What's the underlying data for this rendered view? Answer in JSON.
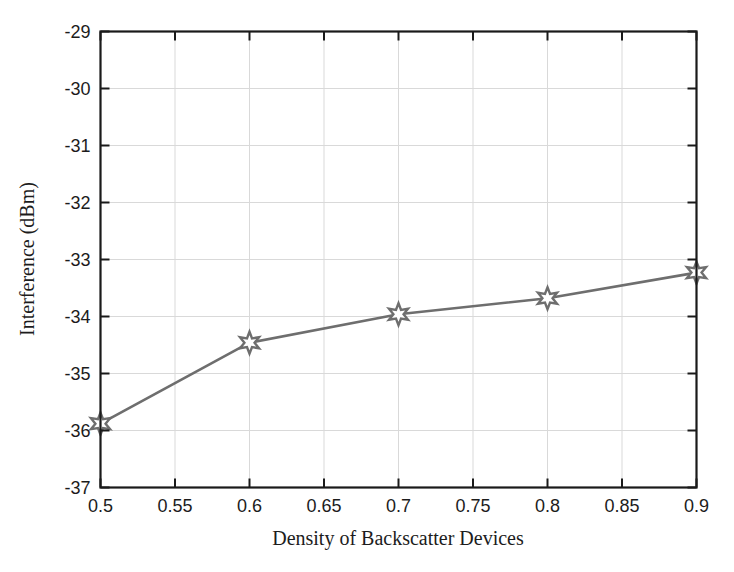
{
  "figure": {
    "background_color": "#ffffff",
    "axis_color": "#1a1a1a",
    "grid_color": "#d9d9d9",
    "series_color": "#6e6e6e",
    "marker_fill": "#ffffff"
  },
  "chart_data": {
    "type": "line",
    "title": "",
    "subtitle": "",
    "xlabel": "Density of Backscatter Devices",
    "ylabel": "Interference (dBm)",
    "xlim": [
      0.5,
      0.9
    ],
    "ylim": [
      -37,
      -29
    ],
    "grid": true,
    "legend": null,
    "legend_position": "none",
    "xticks": [
      0.5,
      0.55,
      0.6,
      0.65,
      0.7,
      0.75,
      0.8,
      0.85,
      0.9
    ],
    "xtick_labels": [
      "0.5",
      "0.55",
      "0.6",
      "0.65",
      "0.7",
      "0.75",
      "0.8",
      "0.85",
      "0.9"
    ],
    "yticks": [
      -37,
      -36,
      -35,
      -34,
      -33,
      -32,
      -31,
      -30,
      -29
    ],
    "ytick_labels": [
      "-37",
      "-36",
      "-35",
      "-34",
      "-33",
      "-32",
      "-31",
      "-30",
      "-29"
    ],
    "marker": "hexagram",
    "series": [
      {
        "name": "Interference",
        "x": [
          0.5,
          0.6,
          0.7,
          0.8,
          0.9
        ],
        "values": [
          -35.88,
          -34.46,
          -33.96,
          -33.68,
          -33.23
        ]
      }
    ]
  }
}
